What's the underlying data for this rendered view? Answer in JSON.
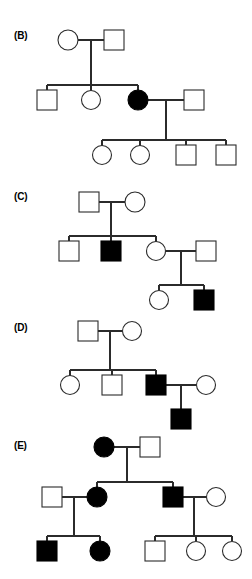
{
  "figure": {
    "width": 252,
    "height": 579,
    "background": "#ffffff",
    "line_color": "#2b2b2b",
    "affected_color": "#000000",
    "unaffected_color": "#ffffff",
    "symbol_legend": {
      "square": "male",
      "circle": "female",
      "filled": "affected",
      "open": "unaffected"
    }
  },
  "panels": [
    {
      "id": "panel-b",
      "label": "(B)",
      "label_x": 14,
      "label_y": 30,
      "generations": [
        {
          "name": "generation-i",
          "individuals": [
            {
              "id": "b-I-1",
              "shape": "circle",
              "sex": "female",
              "status": "unaffected",
              "cx": 68,
              "cy": 40
            },
            {
              "id": "b-I-2",
              "shape": "square",
              "sex": "male",
              "status": "unaffected",
              "cx": 114,
              "cy": 40
            }
          ]
        },
        {
          "name": "generation-ii",
          "individuals": [
            {
              "id": "b-II-1",
              "shape": "square",
              "sex": "male",
              "status": "unaffected",
              "cx": 47,
              "cy": 100
            },
            {
              "id": "b-II-2",
              "shape": "circle",
              "sex": "female",
              "status": "unaffected",
              "cx": 91,
              "cy": 100
            },
            {
              "id": "b-II-3",
              "shape": "circle",
              "sex": "female",
              "status": "affected",
              "cx": 138,
              "cy": 100
            },
            {
              "id": "b-II-4",
              "shape": "square",
              "sex": "male",
              "status": "unaffected",
              "cx": 194,
              "cy": 100
            }
          ]
        },
        {
          "name": "generation-iii",
          "individuals": [
            {
              "id": "b-III-1",
              "shape": "circle",
              "sex": "female",
              "status": "unaffected",
              "cx": 102,
              "cy": 155
            },
            {
              "id": "b-III-2",
              "shape": "circle",
              "sex": "female",
              "status": "unaffected",
              "cx": 140,
              "cy": 155
            },
            {
              "id": "b-III-3",
              "shape": "square",
              "sex": "male",
              "status": "unaffected",
              "cx": 186,
              "cy": 155
            },
            {
              "id": "b-III-4",
              "shape": "square",
              "sex": "male",
              "status": "unaffected",
              "cx": 226,
              "cy": 155
            }
          ]
        }
      ]
    },
    {
      "id": "panel-c",
      "label": "(C)",
      "label_x": 14,
      "label_y": 191,
      "generations": [
        {
          "name": "generation-i",
          "individuals": [
            {
              "id": "c-I-1",
              "shape": "square",
              "sex": "male",
              "status": "unaffected",
              "cx": 89,
              "cy": 202
            },
            {
              "id": "c-I-2",
              "shape": "circle",
              "sex": "female",
              "status": "unaffected",
              "cx": 135,
              "cy": 202
            }
          ]
        },
        {
          "name": "generation-ii",
          "individuals": [
            {
              "id": "c-II-1",
              "shape": "square",
              "sex": "male",
              "status": "unaffected",
              "cx": 69,
              "cy": 251
            },
            {
              "id": "c-II-2",
              "shape": "square",
              "sex": "male",
              "status": "affected",
              "cx": 111,
              "cy": 251
            },
            {
              "id": "c-II-3",
              "shape": "circle",
              "sex": "female",
              "status": "unaffected",
              "cx": 156,
              "cy": 251
            },
            {
              "id": "c-II-4",
              "shape": "square",
              "sex": "male",
              "status": "unaffected",
              "cx": 206,
              "cy": 251
            }
          ]
        },
        {
          "name": "generation-iii",
          "individuals": [
            {
              "id": "c-III-1",
              "shape": "circle",
              "sex": "female",
              "status": "unaffected",
              "cx": 159,
              "cy": 300
            },
            {
              "id": "c-III-2",
              "shape": "square",
              "sex": "male",
              "status": "affected",
              "cx": 204,
              "cy": 300
            }
          ]
        }
      ]
    },
    {
      "id": "panel-d",
      "label": "(D)",
      "label_x": 14,
      "label_y": 322,
      "generations": [
        {
          "name": "generation-i",
          "individuals": [
            {
              "id": "d-I-1",
              "shape": "square",
              "sex": "male",
              "status": "unaffected",
              "cx": 88,
              "cy": 331
            },
            {
              "id": "d-I-2",
              "shape": "circle",
              "sex": "female",
              "status": "unaffected",
              "cx": 132,
              "cy": 331
            }
          ]
        },
        {
          "name": "generation-ii",
          "individuals": [
            {
              "id": "d-II-1",
              "shape": "circle",
              "sex": "female",
              "status": "unaffected",
              "cx": 70,
              "cy": 385
            },
            {
              "id": "d-II-2",
              "shape": "square",
              "sex": "male",
              "status": "unaffected",
              "cx": 112,
              "cy": 385
            },
            {
              "id": "d-II-3",
              "shape": "square",
              "sex": "male",
              "status": "affected",
              "cx": 156,
              "cy": 385
            },
            {
              "id": "d-II-4",
              "shape": "circle",
              "sex": "female",
              "status": "unaffected",
              "cx": 206,
              "cy": 385
            }
          ]
        },
        {
          "name": "generation-iii",
          "individuals": [
            {
              "id": "d-III-1",
              "shape": "square",
              "sex": "male",
              "status": "affected",
              "cx": 181,
              "cy": 419
            }
          ]
        }
      ]
    },
    {
      "id": "panel-e",
      "label": "(E)",
      "label_x": 14,
      "label_y": 440,
      "generations": [
        {
          "name": "generation-i",
          "individuals": [
            {
              "id": "e-I-1",
              "shape": "circle",
              "sex": "female",
              "status": "affected",
              "cx": 104,
              "cy": 447
            },
            {
              "id": "e-I-2",
              "shape": "square",
              "sex": "male",
              "status": "unaffected",
              "cx": 150,
              "cy": 447
            }
          ]
        },
        {
          "name": "generation-ii",
          "individuals": [
            {
              "id": "e-II-1",
              "shape": "square",
              "sex": "male",
              "status": "unaffected",
              "cx": 52,
              "cy": 497
            },
            {
              "id": "e-II-2",
              "shape": "circle",
              "sex": "female",
              "status": "affected",
              "cx": 97,
              "cy": 497
            },
            {
              "id": "e-II-3",
              "shape": "square",
              "sex": "male",
              "status": "affected",
              "cx": 173,
              "cy": 497
            },
            {
              "id": "e-II-4",
              "shape": "circle",
              "sex": "female",
              "status": "unaffected",
              "cx": 216,
              "cy": 497
            }
          ]
        },
        {
          "name": "generation-iii",
          "individuals": [
            {
              "id": "e-III-1",
              "shape": "square",
              "sex": "male",
              "status": "affected",
              "cx": 47,
              "cy": 551
            },
            {
              "id": "e-III-2",
              "shape": "circle",
              "sex": "female",
              "status": "affected",
              "cx": 100,
              "cy": 551
            },
            {
              "id": "e-III-3",
              "shape": "square",
              "sex": "male",
              "status": "unaffected",
              "cx": 155,
              "cy": 551
            },
            {
              "id": "e-III-4",
              "shape": "circle",
              "sex": "female",
              "status": "unaffected",
              "cx": 196,
              "cy": 551
            },
            {
              "id": "e-III-5",
              "shape": "circle",
              "sex": "female",
              "status": "unaffected",
              "cx": 232,
              "cy": 551
            }
          ]
        }
      ]
    }
  ]
}
